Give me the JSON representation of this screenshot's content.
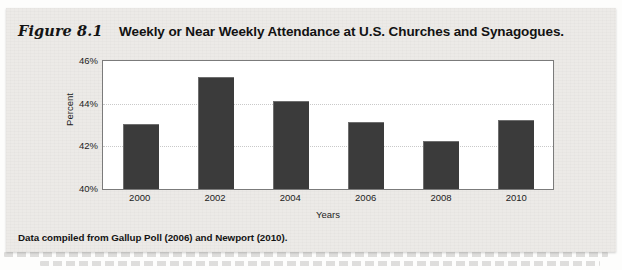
{
  "figure": {
    "number": "Figure 8.1",
    "title": "Weekly or Near Weekly Attendance at U.S. Churches and Synagogues.",
    "source_note": "Data compiled from Gallup Poll (2006) and Newport (2010)."
  },
  "chart_data": {
    "type": "bar",
    "title": "Weekly or Near Weekly Attendance at U.S. Churches and Synagogues.",
    "categories": [
      "2000",
      "2002",
      "2004",
      "2006",
      "2008",
      "2010"
    ],
    "values": [
      43.0,
      45.2,
      44.1,
      43.1,
      42.2,
      43.2
    ],
    "xlabel": "Years",
    "ylabel": "Percent",
    "ylim": [
      40,
      46
    ],
    "yticks": [
      "40%",
      "42%",
      "44%",
      "46%"
    ],
    "ytick_values": [
      40,
      42,
      44,
      46
    ],
    "gridlines": [
      42,
      44
    ],
    "grid": true,
    "legend": null,
    "bar_color": "#3b3b3b",
    "plot_background": "#ffffff",
    "panel_background": "#eceae7"
  }
}
